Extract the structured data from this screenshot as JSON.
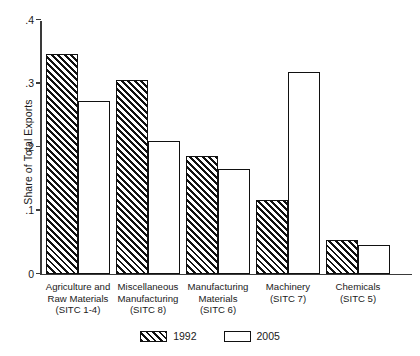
{
  "chart_data": {
    "type": "bar",
    "title": "",
    "xlabel": "",
    "ylabel": "Share of Total Exports",
    "ylim": [
      0,
      0.4
    ],
    "ytick_labels": [
      "0",
      ".1",
      ".2",
      ".3",
      ".4"
    ],
    "ytick_values": [
      0,
      0.1,
      0.2,
      0.3,
      0.4
    ],
    "grid": false,
    "legend_position": "bottom-center",
    "categories": [
      "Agriculture and Raw Materials (SITC 1-4)",
      "Miscellaneous Manufacturing (SITC 8)",
      "Manufacturing Materials (SITC 6)",
      "Machinery (SITC 7)",
      "Chemicals (SITC 5)"
    ],
    "category_lines": [
      [
        "Agriculture and",
        "Raw Materials",
        "(SITC 1-4)"
      ],
      [
        "Miscellaneous",
        "Manufacturing",
        "(SITC 8)"
      ],
      [
        "Manufacturing",
        "Materials",
        "(SITC 6)"
      ],
      [
        "Machinery",
        "(SITC 7)"
      ],
      [
        "Chemicals",
        "(SITC 5)"
      ]
    ],
    "series": [
      {
        "name": "1992",
        "style": "hatched",
        "values": [
          0.345,
          0.305,
          0.185,
          0.115,
          0.052
        ]
      },
      {
        "name": "2005",
        "style": "open",
        "values": [
          0.272,
          0.208,
          0.165,
          0.318,
          0.045
        ]
      }
    ]
  },
  "legend": {
    "items": [
      {
        "label": "1992",
        "style": "hatched"
      },
      {
        "label": "2005",
        "style": "open"
      }
    ]
  },
  "colors": {
    "axis": "#3a3a3a",
    "bar_outline": "#111111",
    "hatch": "#111111",
    "background": "#ffffff",
    "text": "#1a1a1a"
  }
}
